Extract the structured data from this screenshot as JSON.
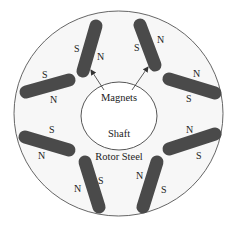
{
  "diagram": {
    "type": "rotor-cross-section",
    "colors": {
      "background": "#ffffff",
      "outline": "#555555",
      "magnet_fill": "#4a4a4a",
      "text": "#222222"
    },
    "labels": {
      "magnets": "Magnets",
      "shaft": "Shaft",
      "rotor_steel": "Rotor Steel"
    },
    "magnets": [
      {
        "id": "top-left",
        "pole_a": "S",
        "pole_b": "N"
      },
      {
        "id": "top-right",
        "pole_a": "S",
        "pole_b": "N"
      },
      {
        "id": "left-upper",
        "pole_a": "S",
        "pole_b": "N"
      },
      {
        "id": "right-upper",
        "pole_a": "N",
        "pole_b": "S"
      },
      {
        "id": "left-lower",
        "pole_a": "S",
        "pole_b": "N"
      },
      {
        "id": "right-lower",
        "pole_a": "N",
        "pole_b": "S"
      },
      {
        "id": "bottom-left",
        "pole_a": "N",
        "pole_b": "S"
      },
      {
        "id": "bottom-right",
        "pole_a": "N",
        "pole_b": "S"
      }
    ]
  }
}
